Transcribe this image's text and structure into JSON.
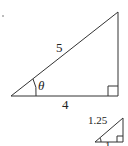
{
  "diagram": {
    "large_triangle": {
      "hypotenuse_label": "5",
      "base_label": "4",
      "angle_label": "θ",
      "right_angle": true
    },
    "small_triangle": {
      "hypotenuse_label": "1.25",
      "base_label": "1",
      "right_angle": true
    },
    "marker": "·"
  }
}
